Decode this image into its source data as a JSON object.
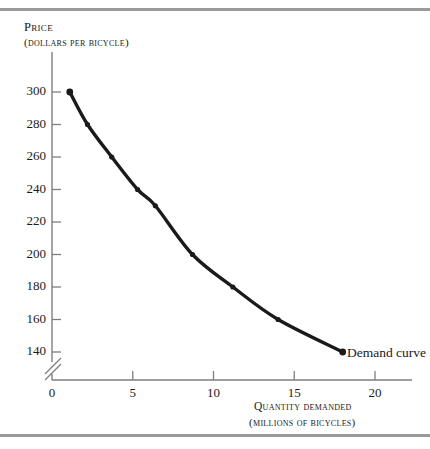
{
  "figure": {
    "background_color": "#ffffff",
    "rule_color": "#9a9a9c",
    "curve_color": "#1a1a1a",
    "has_top_rule": true,
    "has_bottom_rule": true
  },
  "chart_data": {
    "type": "line",
    "title": "",
    "subtitle": "",
    "ylabel": "Price",
    "ylabel_units": "(dollars per bicycle)",
    "xlabel": "Quantity demanded",
    "xlabel_units": "(millions of bicycles)",
    "xlim": [
      0,
      22.5
    ],
    "ylim": [
      130,
      310
    ],
    "y_axis_break": true,
    "grid": false,
    "legend_position": "inline-right",
    "annotations": [
      {
        "text": "Demand curve",
        "x": 18.5,
        "y": 142
      }
    ],
    "xticks": [
      0,
      5,
      10,
      15,
      20
    ],
    "xtick_labels": [
      "0",
      "5",
      "10",
      "15",
      "20"
    ],
    "yticks": [
      140,
      160,
      180,
      200,
      220,
      240,
      260,
      280,
      300
    ],
    "ytick_labels": [
      "140",
      "160",
      "180",
      "200",
      "220",
      "240",
      "260",
      "280",
      "300"
    ],
    "series": [
      {
        "name": "Demand curve",
        "marker": "dot",
        "x": [
          1.1,
          2.2,
          3.7,
          5.3,
          6.4,
          8.7,
          11.2,
          14.0,
          18.0
        ],
        "y": [
          300,
          280,
          260,
          240,
          230,
          200,
          180,
          160,
          140
        ]
      }
    ]
  }
}
